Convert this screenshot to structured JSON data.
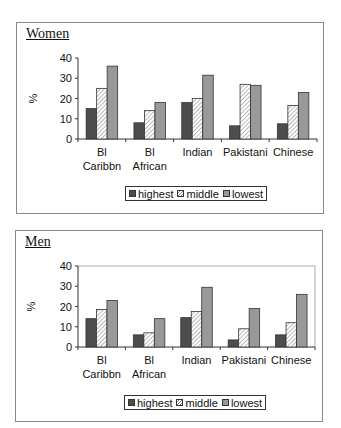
{
  "chart_data": [
    {
      "type": "bar",
      "title": "Women",
      "xlabel": "",
      "ylabel": "%",
      "ylim": [
        0,
        40
      ],
      "yticks": [
        0,
        10,
        20,
        30,
        40
      ],
      "grid": false,
      "legend_position": "bottom",
      "categories": [
        "Bl Caribbn",
        "Bl African",
        "Indian",
        "Pakistani",
        "Chinese"
      ],
      "category_lines": [
        [
          "Bl",
          "Caribbn"
        ],
        [
          "Bl",
          "African"
        ],
        [
          "Indian"
        ],
        [
          "Pakistani"
        ],
        [
          "Chinese"
        ]
      ],
      "series": [
        {
          "name": "highest",
          "values": [
            15,
            8,
            18,
            6.5,
            7.5
          ]
        },
        {
          "name": "middle",
          "values": [
            25,
            14,
            20,
            27,
            16.5
          ]
        },
        {
          "name": "lowest",
          "values": [
            36,
            18,
            31.5,
            26.5,
            23
          ]
        }
      ]
    },
    {
      "type": "bar",
      "title": "Men",
      "xlabel": "",
      "ylabel": "%",
      "ylim": [
        0,
        40
      ],
      "yticks": [
        0,
        10,
        20,
        30,
        40
      ],
      "grid": false,
      "legend_position": "bottom",
      "categories": [
        "Bl Caribbn",
        "Bl African",
        "Indian",
        "Pakistani",
        "Chinese"
      ],
      "category_lines": [
        [
          "Bl",
          "Caribbn"
        ],
        [
          "Bl",
          "African"
        ],
        [
          "Indian"
        ],
        [
          "Pakistani"
        ],
        [
          "Chinese"
        ]
      ],
      "series": [
        {
          "name": "highest",
          "values": [
            14,
            6,
            14.5,
            3.5,
            6
          ]
        },
        {
          "name": "middle",
          "values": [
            18.5,
            7,
            17.5,
            9,
            12
          ]
        },
        {
          "name": "lowest",
          "values": [
            23,
            14,
            29.5,
            19,
            26
          ]
        }
      ]
    }
  ],
  "panels": {
    "women": {
      "title": "Women"
    },
    "men": {
      "title": "Men"
    }
  },
  "legend": {
    "items": [
      "highest",
      "middle",
      "lowest"
    ]
  },
  "colors": {
    "highest": "#4d4d4d",
    "middle_fill": "#ffffff",
    "middle_hatch": "#888888",
    "lowest": "#999999",
    "axis": "#333333",
    "frame": "#8a8a8a"
  }
}
